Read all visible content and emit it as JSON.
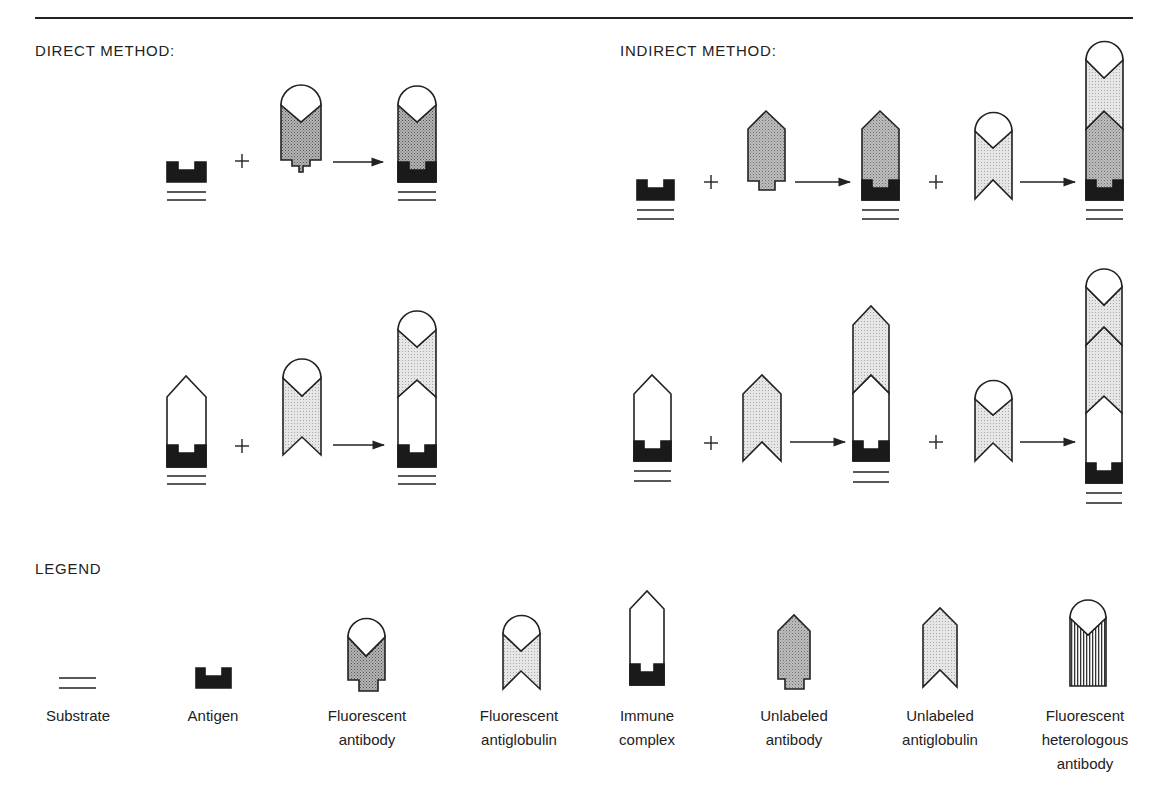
{
  "headings": {
    "direct": "DIRECT METHOD:",
    "indirect": "INDIRECT METHOD:",
    "legend": "LEGEND"
  },
  "operators": {
    "plus": "+"
  },
  "colors": {
    "outline": "#222222",
    "antigen": "#1a1a1a",
    "fluorescent_antibody_fill": "#9a9a9a",
    "unlabeled_antibody_fill": "#8a8a8a",
    "antiglobulin_fill": "#d4d4d4",
    "immune_complex_fill": "#ffffff"
  },
  "diagram": {
    "direct_method": {
      "row1": [
        "antigen on substrate",
        "+",
        "fluorescent antibody",
        "→",
        "antigen bound to fluorescent antibody on substrate"
      ],
      "row2": [
        "immune complex on substrate",
        "+",
        "fluorescent antiglobulin",
        "→",
        "immune complex bound to fluorescent antiglobulin"
      ]
    },
    "indirect_method": {
      "row1": [
        "antigen on substrate",
        "+",
        "unlabeled antibody",
        "→",
        "antigen-antibody on substrate",
        "+",
        "fluorescent antiglobulin",
        "→",
        "antigen-antibody-fluorescent antiglobulin on substrate"
      ],
      "row2": [
        "immune complex on substrate",
        "+",
        "unlabeled antiglobulin",
        "→",
        "complex with unlabeled antiglobulin",
        "+",
        "fluorescent antiglobulin",
        "→",
        "complex with unlabeled and fluorescent antiglobulin"
      ]
    }
  },
  "legend": {
    "items": [
      {
        "icon": "substrate-icon",
        "lines": [
          "Substrate"
        ]
      },
      {
        "icon": "antigen-icon",
        "lines": [
          "Antigen"
        ]
      },
      {
        "icon": "fluorescent-antibody-icon",
        "lines": [
          "Fluorescent",
          "antibody"
        ]
      },
      {
        "icon": "fluorescent-antiglobulin-icon",
        "lines": [
          "Fluorescent",
          "antiglobulin"
        ]
      },
      {
        "icon": "immune-complex-icon",
        "lines": [
          "Immune",
          "complex"
        ]
      },
      {
        "icon": "unlabeled-antibody-icon",
        "lines": [
          "Unlabeled",
          "antibody"
        ]
      },
      {
        "icon": "unlabeled-antiglobulin-icon",
        "lines": [
          "Unlabeled",
          "antiglobulin"
        ]
      },
      {
        "icon": "fluorescent-heterologous-antibody-icon",
        "lines": [
          "Fluorescent",
          "heterologous",
          "antibody"
        ]
      }
    ]
  }
}
